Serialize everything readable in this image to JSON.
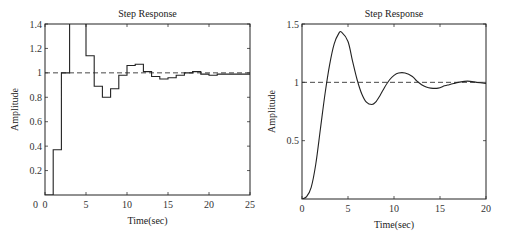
{
  "chart_data": [
    {
      "type": "line",
      "subtype": "step",
      "title": "Step Response",
      "xlabel": "Time(sec)",
      "ylabel": "Amplitude",
      "xlim": [
        0,
        25
      ],
      "ylim": [
        0,
        1.4
      ],
      "xticks": [
        "0",
        "5",
        "10",
        "15",
        "20",
        "25"
      ],
      "yticks": [
        "0.2",
        "0.4",
        "0.6",
        "0.8",
        "1",
        "1.2",
        "1.4"
      ],
      "reference_line": {
        "y": 1,
        "style": "dashed"
      },
      "grid": false,
      "series": [
        {
          "name": "discrete step response",
          "x": [
            0,
            1,
            2,
            3,
            4,
            5,
            6,
            7,
            8,
            9,
            10,
            11,
            12,
            13,
            14,
            15,
            16,
            17,
            18,
            19,
            20,
            21,
            22,
            23,
            24,
            25
          ],
          "values": [
            0,
            0.37,
            1.0,
            1.6,
            1.55,
            1.14,
            0.89,
            0.8,
            0.87,
            0.98,
            1.06,
            1.07,
            1.01,
            0.97,
            0.95,
            0.96,
            0.98,
            1.0,
            1.01,
            0.99,
            0.98,
            0.99,
            0.99,
            0.99,
            0.99,
            0.99
          ]
        }
      ]
    },
    {
      "type": "line",
      "title": "Step Response",
      "xlabel": "Time(sec)",
      "ylabel": "Amplitude",
      "xlim": [
        0,
        20
      ],
      "ylim": [
        0,
        1.5
      ],
      "xticks": [
        "0",
        "5",
        "10",
        "15",
        "20"
      ],
      "yticks": [
        "0.5",
        "1",
        "1.5"
      ],
      "reference_line": {
        "y": 1,
        "style": "dashed"
      },
      "grid": false,
      "series": [
        {
          "name": "continuous step response",
          "x": [
            0,
            0.5,
            1,
            1.5,
            2,
            2.5,
            3,
            3.5,
            4,
            4.3,
            5,
            5.5,
            6,
            6.5,
            7,
            7.6,
            8,
            8.5,
            9,
            9.5,
            10,
            10.5,
            11.2,
            12,
            12.5,
            13,
            13.5,
            14,
            14.8,
            15.5,
            16,
            16.5,
            17,
            18,
            19,
            20
          ],
          "values": [
            0,
            0.02,
            0.1,
            0.3,
            0.6,
            0.9,
            1.15,
            1.33,
            1.42,
            1.43,
            1.35,
            1.18,
            1.02,
            0.9,
            0.83,
            0.81,
            0.83,
            0.89,
            0.96,
            1.02,
            1.06,
            1.08,
            1.08,
            1.05,
            1.01,
            0.98,
            0.96,
            0.95,
            0.95,
            0.97,
            0.98,
            0.99,
            1.0,
            1.01,
            1.0,
            0.99
          ]
        }
      ]
    }
  ]
}
